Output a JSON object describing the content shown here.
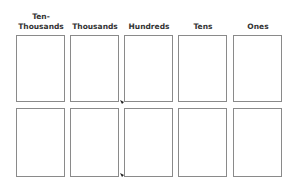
{
  "place_value_chart": {
    "columns": [
      {
        "label": "Ten-\nThousands"
      },
      {
        "label": "Thousands"
      },
      {
        "label": "Hundreds"
      },
      {
        "label": "Tens"
      },
      {
        "label": "Ones"
      }
    ],
    "rows": 2,
    "border_color": "#8a8a8a",
    "label_color": "#333333"
  }
}
